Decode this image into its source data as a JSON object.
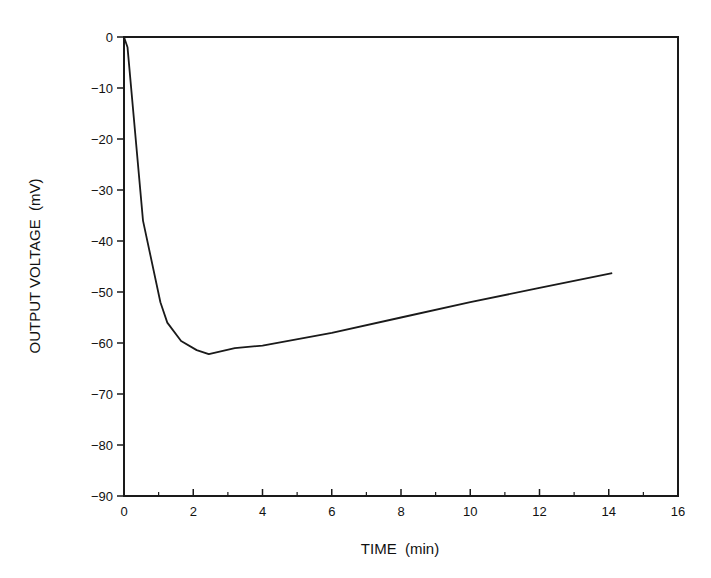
{
  "chart_data": {
    "type": "line",
    "title": "",
    "xlabel": "TIME  (min)",
    "ylabel": "OUTPUT VOLTAGE  (mV)",
    "xlim": [
      0,
      16
    ],
    "ylim": [
      -90,
      0
    ],
    "xticks": [
      0,
      2,
      4,
      6,
      8,
      10,
      12,
      14,
      16
    ],
    "xticks_minor": [
      1,
      3,
      5,
      7,
      9,
      11,
      13,
      15
    ],
    "yticks": [
      0,
      -10,
      -20,
      -30,
      -40,
      -50,
      -60,
      -70,
      -80,
      -90
    ],
    "grid": false,
    "legend": null,
    "series": [
      {
        "name": "output voltage",
        "x": [
          0.0,
          0.1,
          0.55,
          1.05,
          1.25,
          1.65,
          2.1,
          2.45,
          3.2,
          4.0,
          6.0,
          8.0,
          10.0,
          12.0,
          14.1
        ],
        "y": [
          0.0,
          -2.0,
          -36.0,
          -52.0,
          -56.0,
          -59.6,
          -61.4,
          -62.2,
          -61.0,
          -60.5,
          -58.0,
          -55.0,
          -52.0,
          -49.2,
          -46.3
        ]
      }
    ]
  }
}
